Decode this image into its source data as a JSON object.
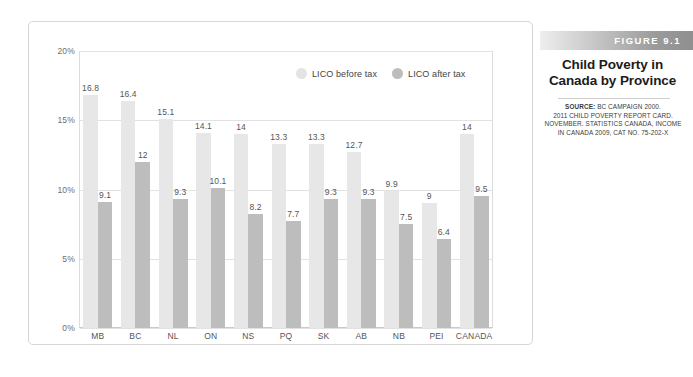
{
  "figure": {
    "band_label": "FIGURE 9.1",
    "title_line1": "Child Poverty in",
    "title_line2": "Canada by Province",
    "source_label": "SOURCE:",
    "source_line1": " BC CAMPAIGN 2000.",
    "source_line2": "2011 CHILD POVERTY REPORT CARD.",
    "source_line3": "NOVEMBER. STATISTICS CANADA, INCOME",
    "source_line4": "IN CANADA 2009, CAT NO. 75-202-X"
  },
  "colors": {
    "before_tax": "#e7e7e7",
    "after_tax": "#bdbdbd",
    "gridline": "#e2e2e2",
    "frame": "#d6d6d6",
    "value_text": "#565656"
  },
  "chart_data": {
    "type": "bar",
    "title": "Child Poverty in Canada by Province",
    "xlabel": "",
    "ylabel": "",
    "ylim": [
      0,
      20
    ],
    "yticks": [
      0,
      5,
      10,
      15,
      20
    ],
    "ytick_labels": [
      "0%",
      "5%",
      "10%",
      "15%",
      "20%"
    ],
    "grid": true,
    "legend_position": "top-right-inside",
    "categories": [
      "MB",
      "BC",
      "NL",
      "ON",
      "NS",
      "PQ",
      "SK",
      "AB",
      "NB",
      "PEI",
      "CANADA"
    ],
    "series": [
      {
        "name": "LICO before tax",
        "color": "#e7e7e7",
        "values": [
          16.8,
          16.4,
          15.1,
          14.1,
          14,
          13.3,
          13.3,
          12.7,
          9.9,
          9,
          14
        ],
        "labels": [
          "16.8",
          "16.4",
          "15.1",
          "14.1",
          "14",
          "13.3",
          "13.3",
          "12.7",
          "9.9",
          "9",
          "14"
        ]
      },
      {
        "name": "LICO after tax",
        "color": "#bdbdbd",
        "values": [
          9.1,
          12,
          9.3,
          10.1,
          8.2,
          7.7,
          9.3,
          9.3,
          7.5,
          6.4,
          9.5
        ],
        "labels": [
          "9.1",
          "12",
          "9.3",
          "10.1",
          "8.2",
          "7.7",
          "9.3",
          "9.3",
          "7.5",
          "6.4",
          "9.5"
        ]
      }
    ]
  }
}
